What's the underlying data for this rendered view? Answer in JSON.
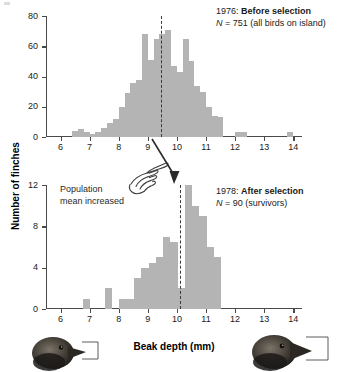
{
  "figure": {
    "y_axis_title": "Number of finches",
    "x_axis_title": "Beak depth (mm)",
    "bar_color": "#b4b4b4",
    "mean_line_color": "#3a3a3a",
    "annotation_note": {
      "line1": "Population",
      "line2": "mean increased",
      "hand_icon": "pointing-hand-icon",
      "arrow_icon": "down-arrow-icon"
    },
    "finch_left": "finch-head-photo-small-beak",
    "finch_right": "finch-head-photo-large-beak"
  },
  "chart_data": [
    {
      "type": "bar",
      "id": "before-selection-1976",
      "title": "1976: Before selection",
      "title_year": "1976:",
      "title_bold": "Before selection",
      "subtitle": "N = 751 (all birds on island)",
      "subtitle_n": "N",
      "subtitle_rest": " = 751 (all birds on island)",
      "xlabel": "Beak depth (mm)",
      "ylabel": "Number of finches",
      "xlim": [
        5.5,
        14.3
      ],
      "ylim": [
        0,
        80
      ],
      "xticks": [
        6,
        7,
        8,
        9,
        10,
        11,
        12,
        13,
        14
      ],
      "yticks": [
        0,
        20,
        40,
        60,
        80
      ],
      "grid": false,
      "legend": "none",
      "bin_width": 0.2,
      "mean_value": 9.45,
      "mean_label": "population mean 1976",
      "bins": [
        6.5,
        6.7,
        6.9,
        7.1,
        7.3,
        7.5,
        7.7,
        7.9,
        8.1,
        8.3,
        8.5,
        8.7,
        8.9,
        9.1,
        9.3,
        9.5,
        9.7,
        9.9,
        10.1,
        10.3,
        10.5,
        10.7,
        10.9,
        11.1,
        11.3,
        11.5,
        12.1,
        12.3,
        13.9
      ],
      "values": [
        4,
        5,
        3,
        2,
        3,
        6,
        9,
        12,
        20,
        29,
        36,
        38,
        68,
        51,
        65,
        68,
        71,
        47,
        43,
        65,
        50,
        34,
        30,
        20,
        14,
        13,
        3,
        3,
        3
      ]
    },
    {
      "type": "bar",
      "id": "after-selection-1978",
      "title": "1978: After selection",
      "title_year": "1978:",
      "title_bold": "After selection",
      "subtitle": "N = 90 (survivors)",
      "subtitle_n": "N",
      "subtitle_rest": " = 90 (survivors)",
      "xlabel": "Beak depth (mm)",
      "ylabel": "Number of finches",
      "xlim": [
        5.5,
        14.3
      ],
      "ylim": [
        0,
        12
      ],
      "xticks": [
        6,
        7,
        8,
        9,
        10,
        11,
        12,
        13,
        14
      ],
      "yticks": [
        0,
        4,
        8,
        12
      ],
      "grid": false,
      "legend": "none",
      "bin_width": 0.25,
      "mean_value": 10.1,
      "mean_label": "population mean 1978",
      "bins": [
        6.9,
        7.65,
        8.15,
        8.4,
        8.65,
        8.9,
        9.15,
        9.4,
        9.65,
        9.9,
        10.15,
        10.4,
        10.65,
        10.9,
        11.15,
        11.4
      ],
      "values": [
        1,
        2,
        1,
        1,
        3,
        4,
        4.5,
        5,
        7,
        6.5,
        2,
        12,
        10,
        9,
        6,
        5
      ],
      "values_right": [
        3,
        2,
        2,
        4,
        3
      ],
      "bins_right": [
        10.65,
        10.9,
        11.15,
        11.3,
        11.5
      ]
    }
  ]
}
